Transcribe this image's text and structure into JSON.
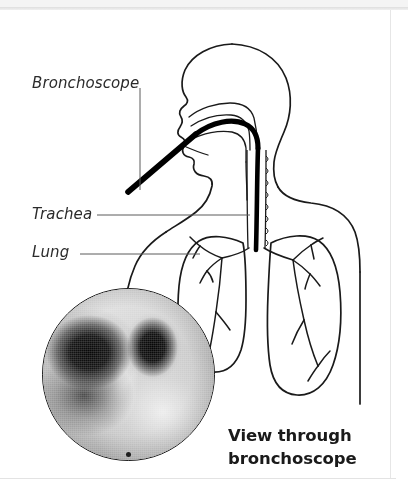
{
  "figure": {
    "type": "medical-illustration",
    "labels": [
      {
        "id": "bronchoscope",
        "text": "Bronchoscope"
      },
      {
        "id": "trachea",
        "text": "Trachea"
      },
      {
        "id": "lung",
        "text": "Lung"
      }
    ],
    "caption": {
      "line1": "View through",
      "line2": "bronchoscope"
    },
    "inset": {
      "name": "bronchoscopy-photo",
      "description": "Circular grayscale endoscopic view of the carina with two dark bronchial openings"
    },
    "colors": {
      "ink": "#1a1a1a",
      "label_text": "#2b2b2b",
      "leader_line": "#555555",
      "page_background": "#ffffff",
      "scope_black": "#000000"
    }
  }
}
